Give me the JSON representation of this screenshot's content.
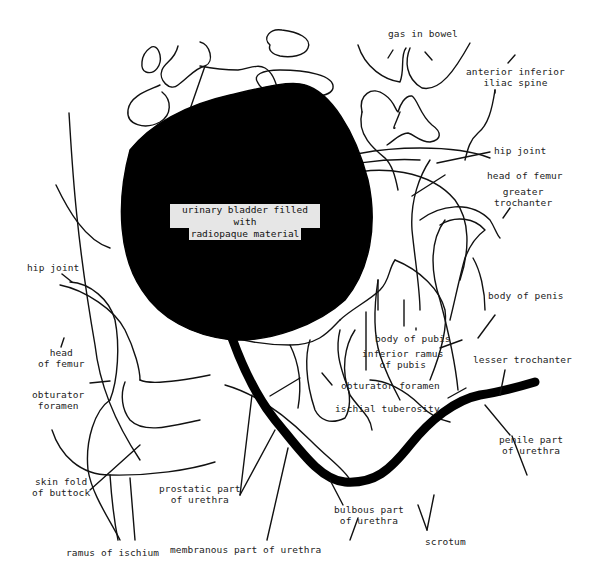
{
  "figure": {
    "type": "radiograph tracing"
  },
  "bladder_label": {
    "line1": "urinary bladder filled with",
    "line2": "radiopaque material"
  },
  "labels": {
    "gas_in_bowel": "gas in bowel",
    "anterior_inferior_iliac_spine": "anterior inferior\niliac spine",
    "hip_joint_right": "hip joint",
    "head_of_femur_right": "head of femur",
    "greater_trochanter": "greater\ntrochanter",
    "hip_joint_left": "hip joint",
    "head_of_femur_left": "head\nof femur",
    "body_of_penis": "body of penis",
    "body_of_pubis": "body of pubis",
    "inferior_ramus_of_pubis": "inferior ramus\nof pubis",
    "lesser_trochanter": "lesser trochanter",
    "obturator_foramen_left": "obturator\nforamen",
    "obturator_foramen_center": "obturator foramen",
    "ischial_tuberosity": "ischial tuberosity",
    "penile_part_of_urethra": "penile part\nof urethra",
    "skin_fold_of_buttock": "skin fold\nof buttock",
    "prostatic_part_of_urethra": "prostatic part\nof urethra",
    "bulbous_part_of_urethra": "bulbous part\nof urethra",
    "scrotum": "scrotum",
    "ramus_of_ischium": "ramus of ischium",
    "membranous_part_of_urethra": "membranous part of urethra"
  },
  "colors": {
    "background": "#ffffff",
    "line": "#111111",
    "contrast_fill": "#000000",
    "label_highlight": "#e6e6e6"
  }
}
